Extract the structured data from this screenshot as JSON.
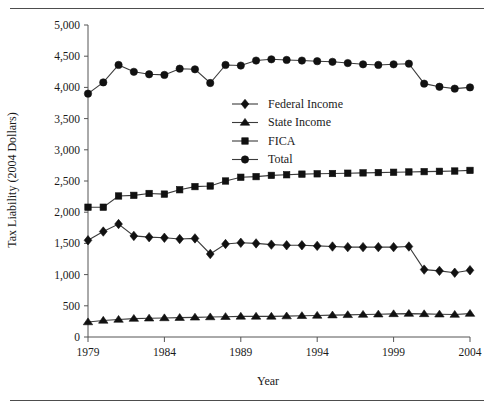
{
  "figure": {
    "has_top_rule": true,
    "has_bottom_rule": true
  },
  "axes": {
    "y_title": "Tax Liability (2004 Dollars)",
    "x_title": "Year",
    "y_ticks": [
      "0",
      "500",
      "1,000",
      "1,500",
      "2,000",
      "2,500",
      "3,000",
      "3,500",
      "4,000",
      "4,500",
      "5,000"
    ],
    "x_ticks": [
      "1979",
      "1984",
      "1989",
      "1994",
      "1999",
      "2004"
    ]
  },
  "legend": {
    "items": [
      {
        "label": "Federal Income",
        "marker": "diamond"
      },
      {
        "label": "State Income",
        "marker": "triangle"
      },
      {
        "label": "FICA",
        "marker": "square"
      },
      {
        "label": "Total",
        "marker": "circle"
      }
    ]
  },
  "chart_data": {
    "type": "line",
    "title": "",
    "subtitle": "",
    "xlabel": "Year",
    "ylabel": "Tax Liability (2004 Dollars)",
    "xlim": [
      1979,
      2004
    ],
    "ylim": [
      0,
      5000
    ],
    "y_tick_values": [
      0,
      500,
      1000,
      1500,
      2000,
      2500,
      3000,
      3500,
      4000,
      4500,
      5000
    ],
    "x_tick_values": [
      1979,
      1984,
      1989,
      1994,
      1999,
      2004
    ],
    "grid": false,
    "legend_position": "center-right-upper",
    "x": [
      1979,
      1980,
      1981,
      1982,
      1983,
      1984,
      1985,
      1986,
      1987,
      1988,
      1989,
      1990,
      1991,
      1992,
      1993,
      1994,
      1995,
      1996,
      1997,
      1998,
      1999,
      2000,
      2001,
      2002,
      2003,
      2004
    ],
    "series": [
      {
        "name": "Federal Income",
        "marker": "diamond",
        "values": [
          1550,
          1690,
          1810,
          1620,
          1600,
          1590,
          1570,
          1580,
          1330,
          1490,
          1510,
          1500,
          1480,
          1470,
          1470,
          1460,
          1450,
          1440,
          1440,
          1440,
          1440,
          1450,
          1080,
          1060,
          1030,
          1070
        ]
      },
      {
        "name": "State Income",
        "marker": "triangle",
        "values": [
          240,
          265,
          280,
          295,
          300,
          305,
          310,
          315,
          320,
          325,
          330,
          330,
          330,
          335,
          340,
          345,
          350,
          355,
          360,
          365,
          370,
          375,
          370,
          365,
          360,
          375
        ]
      },
      {
        "name": "FICA",
        "marker": "square",
        "values": [
          2080,
          2080,
          2260,
          2270,
          2300,
          2290,
          2360,
          2410,
          2420,
          2500,
          2560,
          2570,
          2590,
          2600,
          2610,
          2615,
          2620,
          2625,
          2630,
          2635,
          2640,
          2645,
          2650,
          2655,
          2660,
          2670
        ]
      },
      {
        "name": "Total",
        "marker": "circle",
        "values": [
          3900,
          4080,
          4360,
          4250,
          4210,
          4200,
          4300,
          4290,
          4070,
          4360,
          4350,
          4430,
          4450,
          4440,
          4430,
          4420,
          4410,
          4390,
          4370,
          4360,
          4370,
          4380,
          4060,
          4010,
          3980,
          4000
        ]
      }
    ]
  }
}
